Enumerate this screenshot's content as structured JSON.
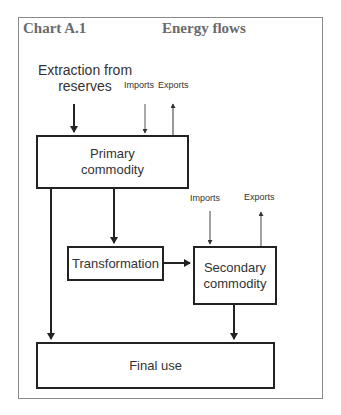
{
  "header": {
    "chart_label": "Chart A.1",
    "title": "Energy flows"
  },
  "diagram": {
    "source_label": "Extraction from reserves",
    "source_label_line1": "Extraction from",
    "source_label_line2": "reserves",
    "primary": {
      "imports_label": "Imports",
      "exports_label": "Exports",
      "box_line1": "Primary",
      "box_line2": "commodity"
    },
    "transformation": {
      "box_label": "Transformation"
    },
    "secondary": {
      "imports_label": "Imports",
      "exports_label": "Exports",
      "box_line1": "Secondary",
      "box_line2": "commodity"
    },
    "final": {
      "box_label": "Final use"
    },
    "flows": [
      {
        "from": "Extraction from reserves",
        "to": "Primary commodity"
      },
      {
        "from": "Imports",
        "to": "Primary commodity"
      },
      {
        "from": "Primary commodity",
        "to": "Exports"
      },
      {
        "from": "Primary commodity",
        "to": "Transformation"
      },
      {
        "from": "Primary commodity",
        "to": "Final use"
      },
      {
        "from": "Transformation",
        "to": "Secondary commodity"
      },
      {
        "from": "Imports",
        "to": "Secondary commodity"
      },
      {
        "from": "Secondary commodity",
        "to": "Exports"
      },
      {
        "from": "Secondary commodity",
        "to": "Final use"
      }
    ]
  },
  "colors": {
    "title": "#6a6a6a",
    "box_border": "#222222",
    "frame_border": "#8a8a8a",
    "text": "#333333"
  }
}
